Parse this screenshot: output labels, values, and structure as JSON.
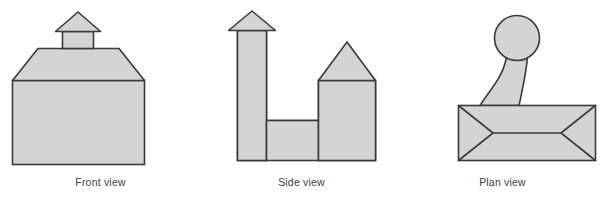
{
  "drawing": {
    "title": "Orthographic projection - three views of a building",
    "background_color": "#ffffff",
    "fill_color": "#d4d4d4",
    "stroke_color": "#3a3a3a",
    "label_color": "#3c3c3c",
    "views": [
      {
        "id": "front",
        "label": "Front view",
        "description": "Rectangular building body with trapezoidal hipped roof and a central cupola with overhanging pitched cap"
      },
      {
        "id": "side",
        "label": "Side view",
        "description": "Tall narrow tower with pitched cap on the left, low middle section, and taller right section with pitched roof"
      },
      {
        "id": "plan",
        "label": "Plan view",
        "description": "Rectangle with hipped-roof diagonal ridge lines, joined by a curved tapering neck to a circle above"
      }
    ]
  }
}
